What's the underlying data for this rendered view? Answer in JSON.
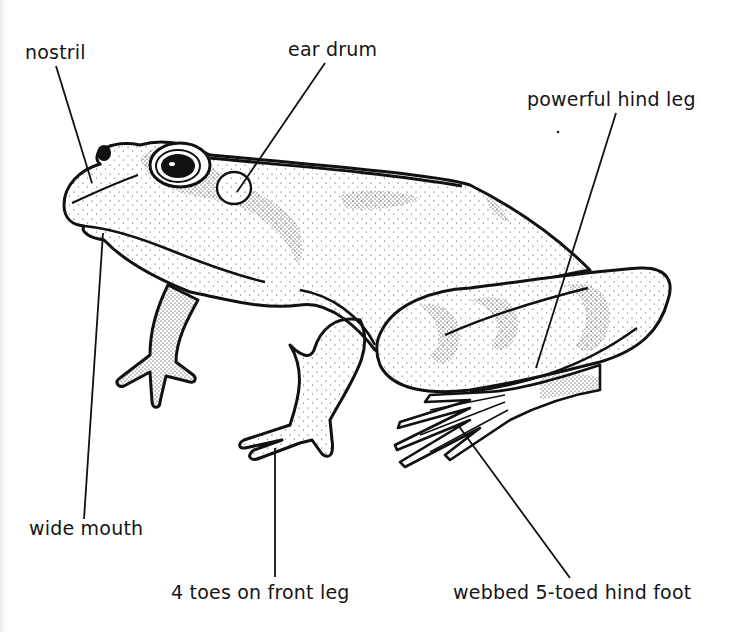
{
  "figure": {
    "background_color": "#ffffff",
    "ink_color": "#111111",
    "labels": [
      {
        "id": "nostril",
        "text": "nostril",
        "x": 25,
        "y": 43,
        "line": [
          56,
          66,
          92,
          183
        ]
      },
      {
        "id": "ear-drum",
        "text": "ear drum",
        "x": 288,
        "y": 40,
        "line": [
          325,
          63,
          237,
          192
        ]
      },
      {
        "id": "powerful-hind-leg",
        "text": "powerful hind leg",
        "x": 527,
        "y": 90,
        "line": [
          616,
          113,
          536,
          368
        ]
      },
      {
        "id": "wide-mouth",
        "text": "wide mouth",
        "x": 29,
        "y": 519,
        "line": [
          103,
          233,
          84,
          519
        ]
      },
      {
        "id": "four-toes-front-leg",
        "text": "4 toes on front leg",
        "x": 171,
        "y": 583,
        "line": [
          275,
          448,
          275,
          577
        ]
      },
      {
        "id": "webbed-hind-foot",
        "text": "webbed 5-toed hind foot",
        "x": 453,
        "y": 583,
        "line": [
          458,
          425,
          570,
          578
        ]
      }
    ]
  }
}
